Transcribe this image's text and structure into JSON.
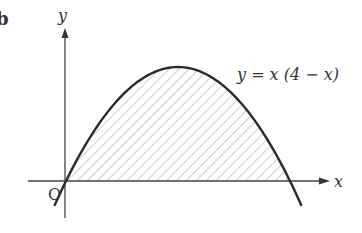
{
  "figure": {
    "part_label": "b",
    "axis_x_label": "x",
    "axis_y_label": "y",
    "origin_label": "O",
    "curve_equation": "y = x (4 − x)",
    "shaded_region": "area between curve and x-axis for 0 ≤ x ≤ 4",
    "colors": {
      "curve": "#2a2a2a",
      "axes": "#444444",
      "hatch": "#9a9a9a",
      "background": "#ffffff"
    }
  },
  "chart_data": {
    "type": "line",
    "title": "",
    "xlabel": "x",
    "ylabel": "y",
    "series": [
      {
        "name": "y = x (4 − x)",
        "x": [
          -0.2,
          0,
          0.5,
          1,
          1.5,
          2,
          2.5,
          3,
          3.5,
          4,
          4.2
        ],
        "values": [
          -0.84,
          0,
          1.75,
          3,
          3.75,
          4,
          3.75,
          3,
          1.75,
          0,
          -0.84
        ]
      }
    ],
    "annotations": [
      "O",
      "y = x (4 − x)"
    ],
    "shaded": {
      "from": 0,
      "to": 4,
      "style": "diagonal hatch"
    },
    "grid": false
  }
}
